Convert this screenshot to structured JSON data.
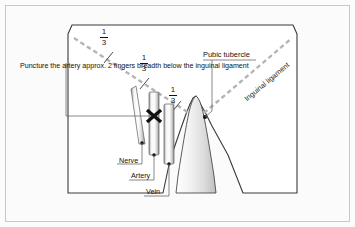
{
  "figure": {
    "background_color": "#fbfbfb",
    "frame_color": "#c9c9c9",
    "outline_color": "#3a3a3a",
    "dashed_line_color": "#b5b5b5",
    "marker_color": "#111111"
  },
  "annotations": {
    "instruction_note": "Puncture the artery approx. 2 fingers breadth below the inguinal ligament",
    "pubic_tubercle": "Pubic tubercle",
    "inguinal_ligament": "Inguinal ligament"
  },
  "vessels": [
    {
      "label": "Nerve",
      "order": 1
    },
    {
      "label": "Artery",
      "order": 2
    },
    {
      "label": "Vein",
      "order": 3
    }
  ],
  "fractions": [
    {
      "numerator": "1",
      "denominator": "3"
    },
    {
      "numerator": "1",
      "denominator": "3"
    },
    {
      "numerator": "1",
      "denominator": "3"
    }
  ],
  "markers": {
    "puncture_site": "x-cross-marker",
    "pubic_tubercle_point": "dot-marker"
  }
}
